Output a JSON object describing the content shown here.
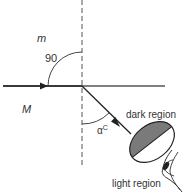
{
  "diagram": {
    "type": "critical-angle-refraction",
    "labels": {
      "upper_medium": "m",
      "lower_medium": "M",
      "right_angle": "90",
      "critical_angle_symbol": "α",
      "critical_angle_sup": "C",
      "dark_region": "dark region",
      "light_region": "light region"
    },
    "colors": {
      "line": "#333333",
      "dashed": "#555555",
      "dark_fill": "#7a7a7a",
      "light_fill": "#ffffff",
      "text": "#333333"
    }
  }
}
